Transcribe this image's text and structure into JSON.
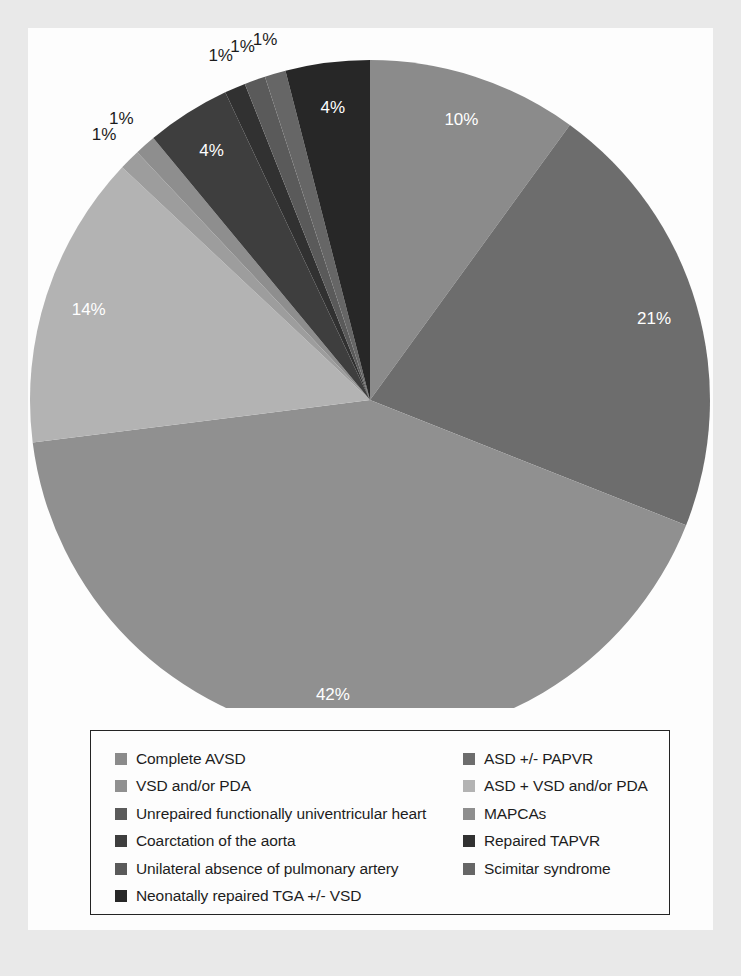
{
  "figure": {
    "background": "#e9e9e9",
    "panel_background": "#fdfdfd"
  },
  "chart_data": {
    "type": "pie",
    "title": "",
    "subtitle": "",
    "xlabel": "",
    "ylabel": "",
    "legend_position": "bottom",
    "grid": false,
    "label_suffix": "%",
    "start_angle_deg": 0,
    "direction": "clockwise",
    "categories": [
      "Complete AVSD",
      "ASD +/- PAPVR",
      "VSD and/or PDA",
      "ASD + VSD and/or PDA",
      "Unrepaired functionally univentricular heart",
      "MAPCAs",
      "Coarctation of the aorta",
      "Repaired TAPVR",
      "Unilateral absence of pulmonary artery",
      "Scimitar syndrome",
      "Neonatally repaired TGA +/- VSD"
    ],
    "values": [
      10,
      21,
      42,
      14,
      1,
      1,
      4,
      1,
      1,
      1,
      4
    ],
    "value_labels": [
      "10%",
      "21%",
      "42%",
      "14%",
      "1%",
      "1%",
      "4%",
      "1%",
      "1%",
      "1%",
      "4%"
    ],
    "colors": [
      "#8b8b8b",
      "#6d6d6d",
      "#909090",
      "#b3b3b3",
      "#9d9d9d",
      "#8e8e8e",
      "#3e3e3e",
      "#313131",
      "#5a5a5a",
      "#666666",
      "#272727"
    ]
  },
  "legend": {
    "border_color": "#242424",
    "columns": [
      {
        "items": [
          {
            "label": "Complete AVSD",
            "color": "#8b8b8b"
          },
          {
            "label": "VSD and/or PDA",
            "color": "#909090"
          },
          {
            "label": "Unrepaired functionally univentricular heart",
            "color": "#5a5a5a"
          },
          {
            "label": "Coarctation of the aorta",
            "color": "#3e3e3e"
          },
          {
            "label": "Unilateral absence of pulmonary artery",
            "color": "#5a5a5a"
          },
          {
            "label": "Neonatally repaired TGA +/- VSD",
            "color": "#272727"
          }
        ]
      },
      {
        "items": [
          {
            "label": "ASD +/- PAPVR",
            "color": "#6d6d6d"
          },
          {
            "label": "ASD + VSD and/or PDA",
            "color": "#b3b3b3"
          },
          {
            "label": "MAPCAs",
            "color": "#8e8e8e"
          },
          {
            "label": "Repaired TAPVR",
            "color": "#313131"
          },
          {
            "label": "Scimitar syndrome",
            "color": "#666666"
          }
        ]
      }
    ]
  }
}
